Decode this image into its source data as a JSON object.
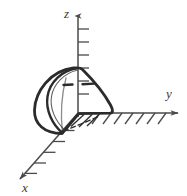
{
  "figure": {
    "background_color": "#ffffff",
    "ink_color": "#2b2b2b",
    "axis_color": "#4a4a4a",
    "label_color": "#3a3a3a",
    "width": 187,
    "height": 196
  },
  "axes": {
    "z": {
      "label": "z",
      "label_x": 66,
      "label_y": 17,
      "origin_x": 78,
      "origin_y": 113,
      "tip_x": 78,
      "tip_y": 13,
      "tick_count": 7,
      "tick_direction": "right",
      "tick_length": 11,
      "tick_spacing": 13,
      "tick_start_y": 29
    },
    "y": {
      "label": "y",
      "label_x": 170,
      "label_y": 97,
      "origin_x": 78,
      "origin_y": 113,
      "tip_x": 180,
      "tip_y": 113,
      "hatch_count": 8,
      "hatch_direction": "below-left-slant",
      "hatch_length": 12,
      "hatch_spacing": 11,
      "hatch_start_x": 100
    },
    "x": {
      "label": "x",
      "label_x": 22,
      "label_y": 192,
      "origin_x": 78,
      "origin_y": 113,
      "tip_x": 15,
      "tip_y": 183,
      "hatch_count": 5,
      "hatch_direction": "right-horizontal",
      "hatch_length": 12,
      "hatch_spacing": 13
    }
  },
  "solid": {
    "name": "quarter-dome-region",
    "description": "hand-drawn quarter paraboloid / dome solid seated at the origin",
    "apex_x": 79,
    "apex_y": 69,
    "base_left_x": 36,
    "base_left_y": 118,
    "base_front_x": 62,
    "base_front_y": 133,
    "base_right_x": 112,
    "base_right_y": 113,
    "stroke_width": 2.6,
    "inner_edge": true,
    "dashed_interior": true,
    "base_hatched": true,
    "dash_pattern": "5 3"
  },
  "annotations": {
    "origin_label": "",
    "interior_dash_segments": 2,
    "base_hatch_count": 3
  }
}
